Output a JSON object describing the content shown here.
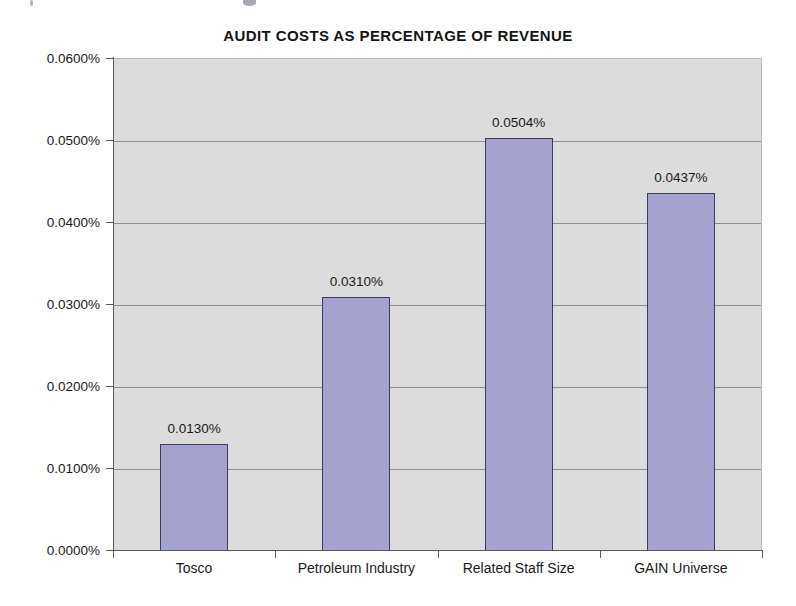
{
  "chart_data": {
    "type": "bar",
    "title": "AUDIT COSTS AS PERCENTAGE OF REVENUE",
    "xlabel": "",
    "ylabel": "",
    "categories": [
      "Tosco",
      "Petroleum Industry",
      "Related Staff Size",
      "GAIN Universe"
    ],
    "values": [
      0.013,
      0.031,
      0.0504,
      0.0437
    ],
    "value_labels": [
      "0.0130%",
      "0.0310%",
      "0.0504%",
      "0.0437%"
    ],
    "ylim": [
      0.0,
      0.06
    ],
    "ytick_values": [
      0.06,
      0.05,
      0.04,
      0.03,
      0.02,
      0.01,
      0.0
    ],
    "ytick_labels": [
      "0.0600%",
      "0.0500%",
      "0.0400%",
      "0.0300%",
      "0.0200%",
      "0.0100%",
      "0.0000%"
    ],
    "grid": true,
    "legend": false,
    "units": "percent",
    "colors": {
      "bar_fill": "#a6a2ce",
      "bar_border": "#3b3b5e",
      "plot_background": "#dcdcdc",
      "gridline": "#8e8e94",
      "axis": "#5a5a5a",
      "text": "#1a1a1a",
      "page_background": "#ffffff"
    }
  }
}
